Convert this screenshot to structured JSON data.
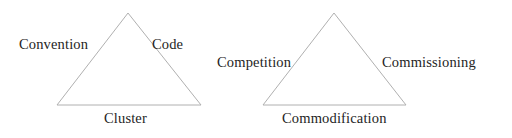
{
  "diagram": {
    "type": "two-triangles",
    "background_color": "#ffffff",
    "stroke_color": "#b0b0b0",
    "text_color": "#242424",
    "triangles": [
      {
        "id": "left-triangle",
        "name": "code-convention-cluster-triangle",
        "apex": {
          "x": 128,
          "y": 13
        },
        "bottom_left": {
          "x": 57,
          "y": 105
        },
        "bottom_right": {
          "x": 201,
          "y": 105
        },
        "labels": {
          "left": "Convention",
          "right": "Code",
          "bottom": "Cluster"
        }
      },
      {
        "id": "right-triangle",
        "name": "competition-commissioning-commodification-triangle",
        "apex": {
          "x": 334,
          "y": 13
        },
        "bottom_left": {
          "x": 263,
          "y": 105
        },
        "bottom_right": {
          "x": 406,
          "y": 105
        },
        "labels": {
          "left": "Competition",
          "right": "Commissioning",
          "bottom": "Commodification"
        }
      }
    ]
  }
}
